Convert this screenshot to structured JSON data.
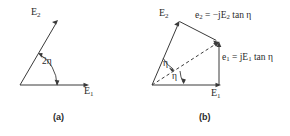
{
  "figure": {
    "background_color": "#ffffff",
    "stroke_color": "#3a3a3a",
    "text_color": "#2b2b2b",
    "panels": [
      {
        "id": "a",
        "caption": "(a)",
        "labels": {
          "e2": "E",
          "e2_sub": "2",
          "e1": "E",
          "e1_sub": "1",
          "angle": "2η"
        }
      },
      {
        "id": "b",
        "caption": "(b)",
        "labels": {
          "e2": "E",
          "e2_sub": "2",
          "e1": "E",
          "e1_sub": "1",
          "angle_upper": "η",
          "angle_lower": "η",
          "eq_e2_lhs": "e",
          "eq_e2_lhs_sub": "2",
          "eq_e2_rhs": " = −jE",
          "eq_e2_rhs_sub": "2",
          "eq_e2_tail": " tan η",
          "eq_e1_lhs": "e",
          "eq_e1_lhs_sub": "1",
          "eq_e1_rhs": " = jE",
          "eq_e1_rhs_sub": "1",
          "eq_e1_tail": " tan η"
        }
      }
    ]
  }
}
